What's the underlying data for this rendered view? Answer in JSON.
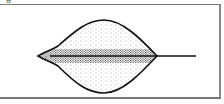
{
  "figure": {
    "label_fragment": "g",
    "colors": {
      "outline": "#111111",
      "stipple": "#333333",
      "border": "#777777",
      "background": "#ffffff"
    },
    "parts": [
      "blade",
      "midrib",
      "stalk"
    ]
  }
}
